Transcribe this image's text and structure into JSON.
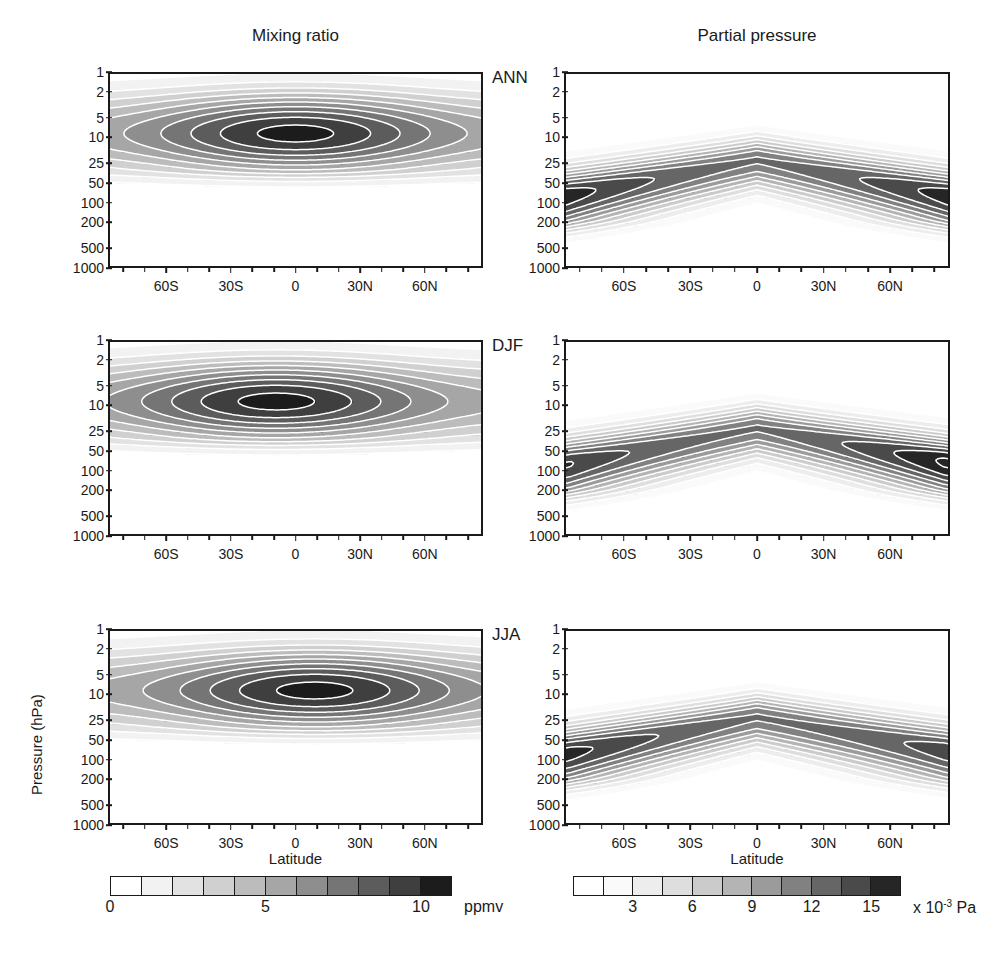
{
  "figure": {
    "column_titles": [
      "Mixing ratio",
      "Partial pressure"
    ],
    "row_labels": [
      "ANN",
      "DJF",
      "JJA"
    ],
    "xaxis_title": "Latitude",
    "yaxis_title": "Pressure (hPa)"
  },
  "axes": {
    "y_ticks": [
      "1",
      "2",
      "5",
      "10",
      "25",
      "50",
      "100",
      "200",
      "500",
      "1000"
    ],
    "y_tick_values": [
      1,
      2,
      5,
      10,
      25,
      50,
      100,
      200,
      500,
      1000
    ],
    "x_ticks_labeled": [
      "60S",
      "30S",
      "0",
      "30N",
      "60N"
    ],
    "x_tick_values": [
      -60,
      -30,
      0,
      30,
      60
    ],
    "x_minor_values": [
      -80,
      -70,
      -50,
      -40,
      -20,
      -10,
      10,
      20,
      40,
      50,
      70,
      80
    ],
    "x_range": [
      -87,
      87
    ],
    "y_range": [
      1,
      1000
    ]
  },
  "colorbars": [
    {
      "id": "mixing-ratio-colorbar",
      "ticks": [
        "0",
        "5",
        "10"
      ],
      "tick_values": [
        0,
        5,
        10
      ],
      "unit": "ppmv",
      "n_segments": 11,
      "levels": [
        0,
        1,
        2,
        3,
        4,
        5,
        6,
        7,
        8,
        9,
        10,
        11
      ],
      "shades": [
        "#ffffff",
        "#f2f2f2",
        "#e2e2e2",
        "#d0d0d0",
        "#bcbcbc",
        "#a6a6a6",
        "#8e8e8e",
        "#757575",
        "#5c5c5c",
        "#3f3f3f",
        "#1c1c1c"
      ]
    },
    {
      "id": "partial-pressure-colorbar",
      "ticks": [
        "3",
        "6",
        "9",
        "12",
        "15"
      ],
      "tick_values": [
        3,
        6,
        9,
        12,
        15
      ],
      "unit_prefix": "x 10",
      "unit_exp": "-3",
      "unit_suffix": "Pa",
      "n_segments": 11,
      "levels": [
        0,
        1.5,
        3,
        4.5,
        6,
        7.5,
        9,
        10.5,
        12,
        13.5,
        15,
        16.5
      ],
      "shades": [
        "#ffffff",
        "#fafafa",
        "#ededed",
        "#dedede",
        "#cbcbcb",
        "#b4b4b4",
        "#9b9b9b",
        "#818181",
        "#666666",
        "#4a4a4a",
        "#262626"
      ]
    }
  ],
  "chart_data": {
    "type": "heatmap",
    "xlabel": "Latitude",
    "ylabel": "Pressure (hPa)",
    "grid": false,
    "legend": "colorbar below each column",
    "xlim": [
      -87,
      87
    ],
    "ylim_hPa": [
      1000,
      1
    ],
    "yscale": "log",
    "panels": [
      {
        "row": "ANN",
        "column": "Mixing ratio",
        "units": "ppmv",
        "contour_levels": [
          1,
          2,
          3,
          4,
          5,
          6,
          7,
          8,
          9,
          10
        ],
        "max_value": 10.2,
        "max_location": {
          "latitude": 0,
          "pressure_hPa": 9
        },
        "description": "Broad ozone mixing ratio maximum centred near the equator at 7-10 hPa, values decaying symmetrically poleward and downward; below ~70 hPa values fall under 1 ppmv.",
        "profile_equator": [
          {
            "pressure_hPa": 1,
            "value": 4.2
          },
          {
            "pressure_hPa": 2,
            "value": 6.5
          },
          {
            "pressure_hPa": 5,
            "value": 9.0
          },
          {
            "pressure_hPa": 8,
            "value": 10.2
          },
          {
            "pressure_hPa": 10,
            "value": 10.0
          },
          {
            "pressure_hPa": 25,
            "value": 6.0
          },
          {
            "pressure_hPa": 50,
            "value": 2.0
          },
          {
            "pressure_hPa": 100,
            "value": 0.4
          },
          {
            "pressure_hPa": 200,
            "value": 0.1
          }
        ],
        "profile_60S": [
          {
            "pressure_hPa": 1,
            "value": 2.2
          },
          {
            "pressure_hPa": 2,
            "value": 3.0
          },
          {
            "pressure_hPa": 5,
            "value": 4.0
          },
          {
            "pressure_hPa": 10,
            "value": 4.5
          },
          {
            "pressure_hPa": 25,
            "value": 3.5
          },
          {
            "pressure_hPa": 50,
            "value": 1.6
          },
          {
            "pressure_hPa": 100,
            "value": 0.4
          }
        ],
        "profile_60N": [
          {
            "pressure_hPa": 1,
            "value": 2.3
          },
          {
            "pressure_hPa": 2,
            "value": 3.2
          },
          {
            "pressure_hPa": 5,
            "value": 4.4
          },
          {
            "pressure_hPa": 10,
            "value": 5.0
          },
          {
            "pressure_hPa": 25,
            "value": 3.8
          },
          {
            "pressure_hPa": 50,
            "value": 1.7
          },
          {
            "pressure_hPa": 100,
            "value": 0.4
          }
        ]
      },
      {
        "row": "DJF",
        "column": "Mixing ratio",
        "units": "ppmv",
        "contour_levels": [
          1,
          2,
          3,
          4,
          5,
          6,
          7,
          8,
          9,
          10
        ],
        "max_value": 10.3,
        "max_location": {
          "latitude": -8,
          "pressure_hPa": 8
        },
        "description": "Mixing ratio maximum displaced slightly into the southern (summer) hemisphere near 8 hPa; a secondary lobe of enhanced values extends toward 40N.",
        "profile_equator": [
          {
            "pressure_hPa": 1,
            "value": 4.5
          },
          {
            "pressure_hPa": 2,
            "value": 6.8
          },
          {
            "pressure_hPa": 5,
            "value": 9.3
          },
          {
            "pressure_hPa": 8,
            "value": 10.3
          },
          {
            "pressure_hPa": 10,
            "value": 10.0
          },
          {
            "pressure_hPa": 25,
            "value": 5.8
          },
          {
            "pressure_hPa": 50,
            "value": 1.9
          },
          {
            "pressure_hPa": 100,
            "value": 0.4
          }
        ]
      },
      {
        "row": "JJA",
        "column": "Mixing ratio",
        "units": "ppmv",
        "contour_levels": [
          1,
          2,
          3,
          4,
          5,
          6,
          7,
          8,
          9,
          10
        ],
        "max_value": 10.1,
        "max_location": {
          "latitude": 8,
          "pressure_hPa": 9
        },
        "description": "Mixing ratio maximum displaced into the northern (summer) hemisphere near 9 hPa; southern high latitudes show the weakest values.",
        "profile_equator": [
          {
            "pressure_hPa": 1,
            "value": 4.1
          },
          {
            "pressure_hPa": 2,
            "value": 6.3
          },
          {
            "pressure_hPa": 5,
            "value": 9.0
          },
          {
            "pressure_hPa": 9,
            "value": 10.1
          },
          {
            "pressure_hPa": 25,
            "value": 5.7
          },
          {
            "pressure_hPa": 50,
            "value": 1.9
          },
          {
            "pressure_hPa": 100,
            "value": 0.4
          }
        ]
      },
      {
        "row": "ANN",
        "column": "Partial pressure",
        "units": "x 10^-3 Pa",
        "contour_levels": [
          1.5,
          3,
          4.5,
          6,
          7.5,
          9,
          10.5,
          12,
          13.5,
          15
        ],
        "max_value": 16.0,
        "max_location": {
          "latitude": 65,
          "pressure_hPa": 60
        },
        "description": "Arched band of maximum ozone partial pressure, highest at extratropical latitudes near 50-70 hPa and lowest/highest-altitude over the tropics near 20-25 hPa.",
        "profile_equator": [
          {
            "pressure_hPa": 5,
            "value": 2.0
          },
          {
            "pressure_hPa": 10,
            "value": 6.0
          },
          {
            "pressure_hPa": 20,
            "value": 12.0
          },
          {
            "pressure_hPa": 30,
            "value": 11.0
          },
          {
            "pressure_hPa": 50,
            "value": 5.0
          },
          {
            "pressure_hPa": 100,
            "value": 1.2
          },
          {
            "pressure_hPa": 200,
            "value": 0.5
          }
        ],
        "profile_60S": [
          {
            "pressure_hPa": 10,
            "value": 2.5
          },
          {
            "pressure_hPa": 25,
            "value": 9.0
          },
          {
            "pressure_hPa": 50,
            "value": 15.2
          },
          {
            "pressure_hPa": 70,
            "value": 13.0
          },
          {
            "pressure_hPa": 100,
            "value": 7.0
          },
          {
            "pressure_hPa": 200,
            "value": 2.0
          }
        ],
        "profile_60N": [
          {
            "pressure_hPa": 10,
            "value": 3.0
          },
          {
            "pressure_hPa": 25,
            "value": 10.0
          },
          {
            "pressure_hPa": 50,
            "value": 14.5
          },
          {
            "pressure_hPa": 70,
            "value": 15.5
          },
          {
            "pressure_hPa": 100,
            "value": 8.0
          },
          {
            "pressure_hPa": 200,
            "value": 2.5
          }
        ]
      },
      {
        "row": "DJF",
        "column": "Partial pressure",
        "units": "x 10^-3 Pa",
        "contour_levels": [
          1.5,
          3,
          4.5,
          6,
          7.5,
          9,
          10.5,
          12,
          13.5,
          15
        ],
        "max_value": 16.5,
        "max_location": {
          "latitude": 68,
          "pressure_hPa": 55
        },
        "description": "Arched band with the strongest partial pressure centre in the northern (winter) high latitudes near 50-60 hPa; a weaker southern maximum near 60S at 50 hPa.",
        "profile_equator": [
          {
            "pressure_hPa": 10,
            "value": 5.5
          },
          {
            "pressure_hPa": 22,
            "value": 12.0
          },
          {
            "pressure_hPa": 50,
            "value": 5.5
          },
          {
            "pressure_hPa": 100,
            "value": 1.3
          }
        ]
      },
      {
        "row": "JJA",
        "column": "Partial pressure",
        "units": "x 10^-3 Pa",
        "contour_levels": [
          1.5,
          3,
          4.5,
          6,
          7.5,
          9,
          10.5,
          12,
          13.5,
          15
        ],
        "max_value": 15.5,
        "max_location": {
          "latitude": -70,
          "pressure_hPa": 70
        },
        "description": "Arched band with the broad maximum extending from the tropics to the southern (winter) high latitudes near 70-100 hPa; northern high latitudes weaker and shallower.",
        "profile_equator": [
          {
            "pressure_hPa": 10,
            "value": 5.0
          },
          {
            "pressure_hPa": 22,
            "value": 12.0
          },
          {
            "pressure_hPa": 50,
            "value": 5.0
          },
          {
            "pressure_hPa": 100,
            "value": 1.2
          }
        ]
      }
    ]
  }
}
